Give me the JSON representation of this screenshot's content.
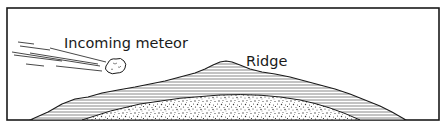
{
  "diagram": {
    "labels": {
      "meteor": "Incoming meteor",
      "ridge": "Ridge"
    },
    "colors": {
      "stroke": "#1a1a1a",
      "background": "#ffffff",
      "hatch": "#555555",
      "stipple": "#333333"
    },
    "elements": [
      {
        "name": "frame",
        "type": "rectangle"
      },
      {
        "name": "meteor",
        "type": "rock-with-motion-streaks"
      },
      {
        "name": "ridge-layer",
        "type": "horizontally-hatched-landform"
      },
      {
        "name": "core-layer",
        "type": "stippled-dome"
      }
    ]
  }
}
